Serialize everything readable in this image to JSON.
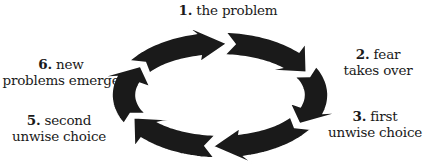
{
  "diagram": {
    "type": "cycle",
    "background": "#ffffff",
    "arrow_color": "#1a1a1a",
    "gap_color": "#ffffff",
    "ring": {
      "cx": 220,
      "cy": 95,
      "outer_rx": 108,
      "outer_ry": 63,
      "inner_rx": 84,
      "inner_ry": 40
    },
    "direction": "clockwise",
    "steps": [
      {
        "number": "1.",
        "line1_text": "the problem",
        "line2_text": "",
        "head_angle_deg": 270
      },
      {
        "number": "2.",
        "line1_text": "fear",
        "line2_text": "takes over",
        "head_angle_deg": 330
      },
      {
        "number": "3.",
        "line1_text": "first",
        "line2_text": "unwise choice",
        "head_angle_deg": 30
      },
      {
        "number": "4.",
        "line1_text": "",
        "line2_text": "",
        "head_angle_deg": 90
      },
      {
        "number": "5.",
        "line1_text": "second",
        "line2_text": "unwise choice",
        "head_angle_deg": 150
      },
      {
        "number": "6.",
        "line1_text": "new",
        "line2_text": "problems emerge",
        "head_angle_deg": 210
      }
    ]
  },
  "labels": {
    "step1": {
      "number": "1.",
      "text": "the problem"
    },
    "step2": {
      "number": "2.",
      "line1": "fear",
      "line2": "takes over"
    },
    "step3": {
      "number": "3.",
      "line1": "first",
      "line2": "unwise choice"
    },
    "step5": {
      "number": "5.",
      "line1": "second",
      "line2": "unwise choice"
    },
    "step6": {
      "number": "6.",
      "line1": "new",
      "line2": "problems emerge"
    }
  }
}
